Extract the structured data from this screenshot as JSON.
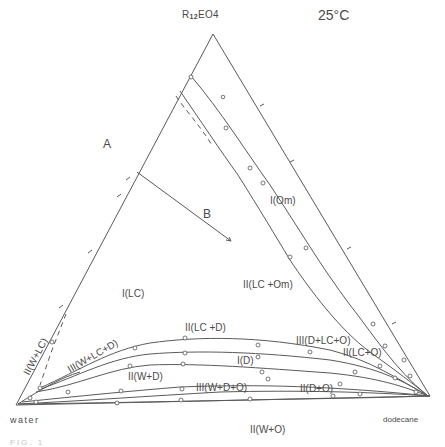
{
  "figure": {
    "component_top": {
      "prefix": "R",
      "sub": "12",
      "suffix": "EO4"
    },
    "temperature": "25°C",
    "vertex_water": "water",
    "vertex_dodecane": "dodecane",
    "path_labels": {
      "start": "A",
      "end": "B"
    },
    "caption_fragment": "FIG. 1"
  },
  "regions": [
    {
      "id": "I_Om",
      "label": "I(Om)",
      "x": 270,
      "y": 196
    },
    {
      "id": "II_LC_Om",
      "label": "II(LC +Om)",
      "x": 243,
      "y": 280
    },
    {
      "id": "I_LC",
      "label": "I(LC)",
      "x": 122,
      "y": 289
    },
    {
      "id": "II_LC_D",
      "label": "II(LC +D)",
      "x": 185,
      "y": 323
    },
    {
      "id": "III_D_LC_O",
      "label": "III(D+LC+O)",
      "x": 296,
      "y": 336
    },
    {
      "id": "II_LC_O",
      "label": "II(LC+O)",
      "x": 343,
      "y": 348
    },
    {
      "id": "I_D",
      "label": "I(D)",
      "x": 237,
      "y": 356
    },
    {
      "id": "II_W_D",
      "label": "II(W+D)",
      "x": 128,
      "y": 372
    },
    {
      "id": "III_W_D_O",
      "label": "III(W+D+O)",
      "x": 196,
      "y": 383
    },
    {
      "id": "II_D_O",
      "label": "II(D+O)",
      "x": 300,
      "y": 384
    },
    {
      "id": "II_W_O",
      "label": "II(W+O)",
      "x": 250,
      "y": 425
    }
  ],
  "rotated_regions": [
    {
      "id": "II_W_LC",
      "label": "II(W+LC)",
      "x": 22,
      "y": 372,
      "angle": -62
    },
    {
      "id": "III_W_LC_D",
      "label": "III(W+LC+D)",
      "x": 66,
      "y": 366,
      "angle": -30
    }
  ],
  "colors": {
    "line": "#555555",
    "text": "#4a4a4a",
    "background": "#ffffff"
  }
}
